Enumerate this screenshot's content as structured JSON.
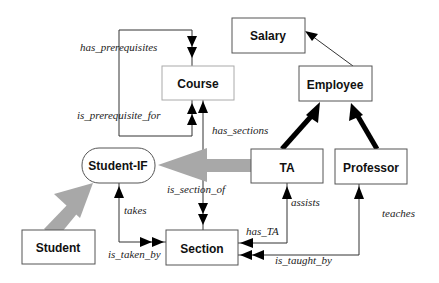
{
  "diagram": {
    "nodes": {
      "salary": "Salary",
      "course": "Course",
      "employee": "Employee",
      "student_if": "Student-IF",
      "ta": "TA",
      "professor": "Professor",
      "student": "Student",
      "section": "Section"
    },
    "edge_labels": {
      "has_prerequisites": "has_prerequisites",
      "is_prerequisite_for": "is_prerequisite_for",
      "has_sections": "has_sections",
      "is_section_of": "is_section_of",
      "takes": "takes",
      "is_taken_by": "is_taken_by",
      "assists": "assists",
      "has_TA": "has_TA",
      "teaches": "teaches",
      "is_taught_by": "is_taught_by"
    },
    "colors": {
      "inheritance_arrow": "#a8a8a8",
      "isa_arrow": "#000000",
      "box_border": "#555555"
    }
  }
}
